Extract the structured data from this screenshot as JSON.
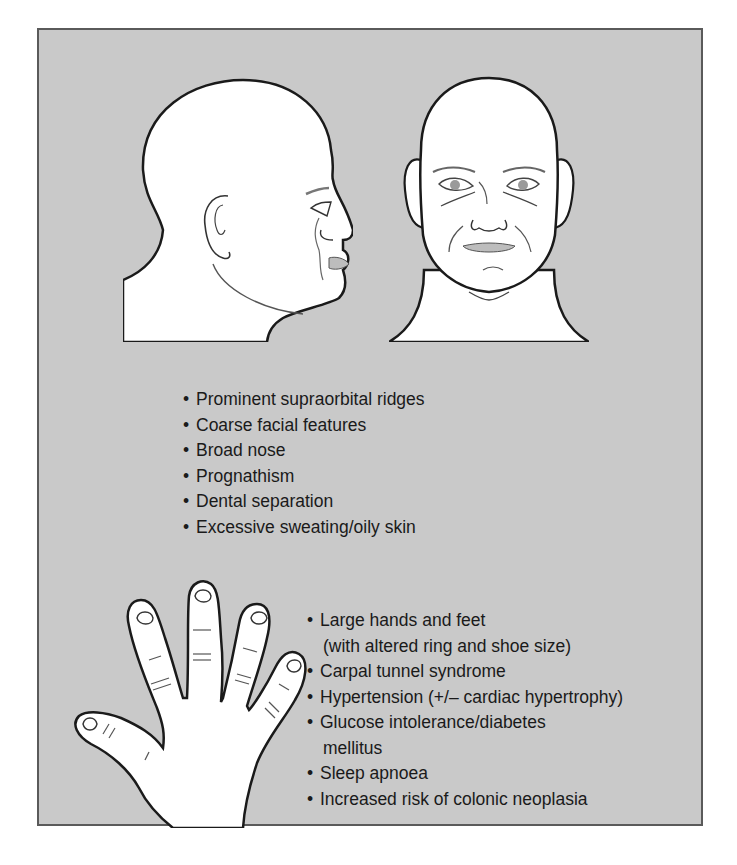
{
  "figure": {
    "background_color": "#c9c9c9",
    "border_color": "#5a5a5a",
    "illustrations": [
      {
        "name": "head-profile",
        "label": "Side profile of head"
      },
      {
        "name": "head-frontal",
        "label": "Frontal view of face"
      },
      {
        "name": "hand",
        "label": "Enlarged hand"
      }
    ],
    "facial_features": [
      {
        "text": "Prominent supraorbital ridges"
      },
      {
        "text": "Coarse facial features"
      },
      {
        "text": "Broad nose"
      },
      {
        "text": "Prognathism"
      },
      {
        "text": "Dental separation"
      },
      {
        "text": "Excessive sweating/oily skin"
      }
    ],
    "systemic_features": [
      {
        "text": "Large hands and feet",
        "cont": "(with altered ring and shoe size)"
      },
      {
        "text": "Carpal tunnel syndrome"
      },
      {
        "text": "Hypertension (+/– cardiac hypertrophy)"
      },
      {
        "text": "Glucose intolerance/diabetes",
        "cont": "mellitus"
      },
      {
        "text": "Sleep apnoea"
      },
      {
        "text": "Increased risk of colonic neoplasia"
      }
    ]
  }
}
